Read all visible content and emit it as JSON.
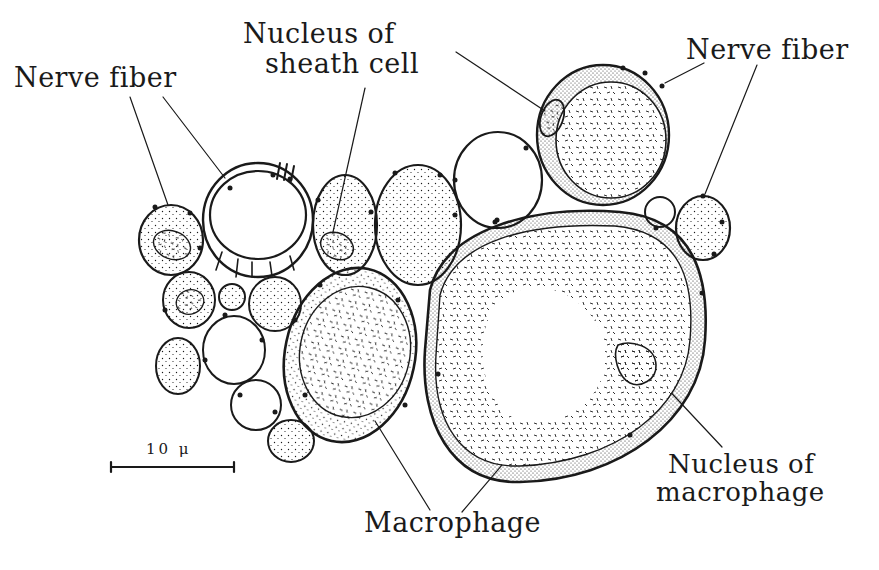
{
  "figure": {
    "background": "#ffffff",
    "ink_color": "#1a1a1a"
  },
  "labels": {
    "nerve_fiber_left": "Nerve fiber",
    "nucleus_sheath_line1": "Nucleus of",
    "nucleus_sheath_line2": "sheath cell",
    "nerve_fiber_right": "Nerve fiber",
    "nucleus_macrophage_line1": "Nucleus of",
    "nucleus_macrophage_line2": "macrophage",
    "macrophage": "Macrophage"
  },
  "scale_bar": {
    "label": "10 μ"
  }
}
